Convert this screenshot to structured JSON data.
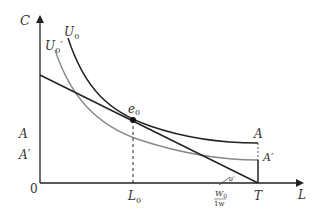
{
  "diagram": {
    "type": "economics-labor-leisure-indifference",
    "axes": {
      "y_label": "C",
      "x_label": "L",
      "origin_label": "0"
    },
    "curves": {
      "U0": {
        "label": "U",
        "sub": "0",
        "color": "#222222"
      },
      "U0_prime": {
        "label": "U",
        "sub": "0",
        "prime": "′",
        "color": "#888888"
      },
      "budget": {
        "color": "#222222"
      }
    },
    "points": {
      "e0": {
        "label": "e",
        "sub": "0"
      }
    },
    "ticks": {
      "L0": {
        "label": "L",
        "sub": "0"
      },
      "T": {
        "label": "T"
      },
      "W0_frac": {
        "num": "W",
        "num_sub": "0",
        "den": "1w"
      },
      "alpha": {
        "label": "a′"
      }
    },
    "levels": {
      "A_left": "A",
      "A_prime_left": "A′",
      "A_right": "A",
      "A_prime_right": "A′"
    }
  }
}
